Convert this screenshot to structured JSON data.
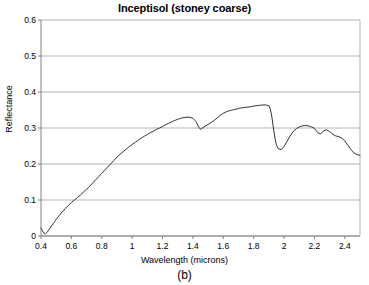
{
  "chart_data": {
    "type": "line",
    "title": "Inceptisol (stoney coarse)",
    "xlabel": "Wavelength (microns)",
    "ylabel": "Reflectance",
    "caption": "(b)",
    "xlim": [
      0.4,
      2.5
    ],
    "ylim": [
      0.0,
      0.6
    ],
    "grid": "horizontal",
    "legend": "none",
    "line_color": "#333333",
    "grid_color": "#b3b3b3",
    "axis_color": "#808080",
    "background": "#ffffff",
    "xticks": [
      0.4,
      0.6,
      0.8,
      1.0,
      1.2,
      1.4,
      1.6,
      1.8,
      2.0,
      2.2,
      2.4
    ],
    "xtick_labels": [
      "0.4",
      "0.6",
      "0.8",
      "1",
      "1.2",
      "1.4",
      "1.6",
      "1.8",
      "2",
      "2.2",
      "2.4"
    ],
    "yticks": [
      0,
      0.1,
      0.2,
      0.3,
      0.4,
      0.5,
      0.6
    ],
    "ytick_labels": [
      "0",
      "0.1",
      "0.2",
      "0.3",
      "0.4",
      "0.5",
      "0.6"
    ],
    "series": [
      {
        "name": "Inceptisol (stoney coarse)",
        "x": [
          0.4,
          0.41,
          0.42,
          0.43,
          0.44,
          0.45,
          0.46,
          0.47,
          0.48,
          0.49,
          0.5,
          0.52,
          0.54,
          0.56,
          0.58,
          0.6,
          0.62,
          0.64,
          0.66,
          0.68,
          0.7,
          0.72,
          0.74,
          0.76,
          0.78,
          0.8,
          0.82,
          0.84,
          0.86,
          0.88,
          0.9,
          0.92,
          0.94,
          0.96,
          0.98,
          1.0,
          1.02,
          1.04,
          1.06,
          1.08,
          1.1,
          1.12,
          1.14,
          1.16,
          1.18,
          1.2,
          1.22,
          1.24,
          1.26,
          1.28,
          1.3,
          1.32,
          1.34,
          1.36,
          1.38,
          1.4,
          1.42,
          1.44,
          1.45,
          1.46,
          1.48,
          1.5,
          1.52,
          1.54,
          1.56,
          1.58,
          1.6,
          1.62,
          1.64,
          1.66,
          1.68,
          1.7,
          1.72,
          1.74,
          1.76,
          1.78,
          1.8,
          1.82,
          1.84,
          1.86,
          1.88,
          1.9,
          1.91,
          1.92,
          1.93,
          1.94,
          1.95,
          1.96,
          1.98,
          2.0,
          2.02,
          2.04,
          2.06,
          2.08,
          2.1,
          2.12,
          2.14,
          2.16,
          2.18,
          2.2,
          2.22,
          2.24,
          2.26,
          2.28,
          2.3,
          2.32,
          2.34,
          2.36,
          2.38,
          2.4,
          2.42,
          2.44,
          2.46,
          2.48,
          2.5
        ],
        "y": [
          0.022,
          0.014,
          0.008,
          0.006,
          0.01,
          0.016,
          0.022,
          0.028,
          0.034,
          0.04,
          0.046,
          0.057,
          0.067,
          0.076,
          0.085,
          0.093,
          0.1,
          0.107,
          0.114,
          0.122,
          0.13,
          0.138,
          0.147,
          0.156,
          0.165,
          0.174,
          0.183,
          0.192,
          0.201,
          0.21,
          0.219,
          0.227,
          0.234,
          0.241,
          0.248,
          0.254,
          0.26,
          0.266,
          0.272,
          0.277,
          0.282,
          0.287,
          0.291,
          0.296,
          0.3,
          0.304,
          0.309,
          0.313,
          0.317,
          0.321,
          0.324,
          0.327,
          0.329,
          0.33,
          0.33,
          0.327,
          0.318,
          0.302,
          0.296,
          0.299,
          0.305,
          0.31,
          0.315,
          0.321,
          0.328,
          0.335,
          0.341,
          0.345,
          0.348,
          0.35,
          0.352,
          0.354,
          0.356,
          0.357,
          0.358,
          0.359,
          0.361,
          0.362,
          0.363,
          0.364,
          0.364,
          0.362,
          0.352,
          0.33,
          0.3,
          0.272,
          0.253,
          0.243,
          0.24,
          0.248,
          0.263,
          0.278,
          0.29,
          0.298,
          0.303,
          0.306,
          0.307,
          0.306,
          0.303,
          0.299,
          0.288,
          0.283,
          0.292,
          0.295,
          0.29,
          0.283,
          0.278,
          0.276,
          0.272,
          0.264,
          0.252,
          0.24,
          0.231,
          0.226,
          0.224
        ]
      }
    ],
    "annotations": {
      "features": [
        {
          "label": "visible rise onset",
          "x": 0.43,
          "y": 0.006
        },
        {
          "label": "local maximum",
          "x": 1.37,
          "y": 0.33
        },
        {
          "label": "water absorption band",
          "x": 1.45,
          "y": 0.296
        },
        {
          "label": "global maximum",
          "x": 1.88,
          "y": 0.364
        },
        {
          "label": "deep absorption band",
          "x": 1.96,
          "y": 0.243
        },
        {
          "label": "secondary maximum",
          "x": 2.14,
          "y": 0.307
        },
        {
          "label": "terminal value",
          "x": 2.5,
          "y": 0.224
        }
      ]
    }
  }
}
